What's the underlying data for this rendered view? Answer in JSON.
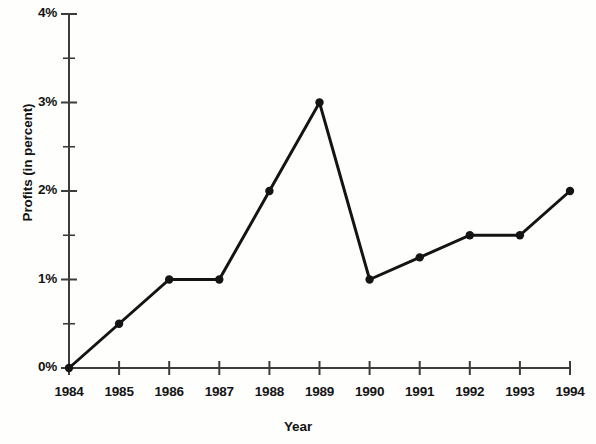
{
  "chart_data": {
    "type": "line",
    "title": "",
    "xlabel": "Year",
    "ylabel": "Profits (in percent)",
    "categories": [
      "1984",
      "1985",
      "1986",
      "1987",
      "1988",
      "1989",
      "1990",
      "1991",
      "1992",
      "1993",
      "1994"
    ],
    "x": [
      1984,
      1985,
      1986,
      1987,
      1988,
      1989,
      1990,
      1991,
      1992,
      1993,
      1994
    ],
    "values": [
      0,
      0.5,
      1,
      1,
      2,
      3,
      1,
      1.25,
      1.5,
      1.5,
      2
    ],
    "series": [
      {
        "name": "Profits",
        "values": [
          0,
          0.5,
          1,
          1,
          2,
          3,
          1,
          1.25,
          1.5,
          1.5,
          2
        ]
      }
    ],
    "ylim": [
      0,
      4
    ],
    "ytick_labels": [
      "0%",
      "1%",
      "2%",
      "3%",
      "4%"
    ],
    "ytick_values": [
      0,
      1,
      2,
      3,
      4
    ],
    "yminor_tick_values": [
      0.5,
      1.5,
      2.5,
      3.5
    ],
    "xtick_labels": [
      "1984",
      "1985",
      "1986",
      "1987",
      "1988",
      "1989",
      "1990",
      "1991",
      "1992",
      "1993",
      "1994"
    ],
    "grid": false,
    "legend": false,
    "legend_position": "none",
    "marker": "circle",
    "line_color": "#141414",
    "marker_color": "#141414",
    "axis_color": "#3c3c3c",
    "background_color": "#fefefd",
    "text_color": "#141414"
  },
  "axes": {
    "y_title": "Profits (in percent)",
    "x_title": "Year"
  },
  "ticks": {
    "y": [
      {
        "label": "4%",
        "value": 4
      },
      {
        "label": "3%",
        "value": 3
      },
      {
        "label": "2%",
        "value": 2
      },
      {
        "label": "1%",
        "value": 1
      },
      {
        "label": "0%",
        "value": 0
      }
    ],
    "x": [
      {
        "label": "1984"
      },
      {
        "label": "1985"
      },
      {
        "label": "1986"
      },
      {
        "label": "1987"
      },
      {
        "label": "1988"
      },
      {
        "label": "1989"
      },
      {
        "label": "1990"
      },
      {
        "label": "1991"
      },
      {
        "label": "1992"
      },
      {
        "label": "1993"
      },
      {
        "label": "1994"
      }
    ]
  }
}
